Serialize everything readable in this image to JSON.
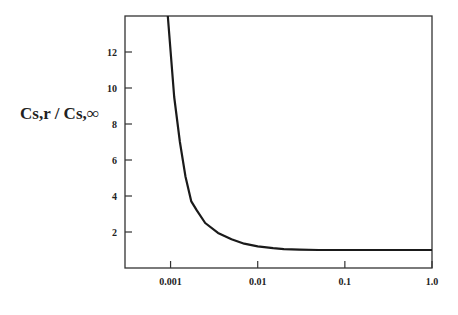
{
  "chart_data": {
    "type": "line",
    "title": "",
    "xlabel": "",
    "ylabel": "Cs,r / Cs,∞",
    "x_scale": "log",
    "xlim": [
      0.0003,
      1.0
    ],
    "ylim": [
      0,
      14
    ],
    "grid": false,
    "legend": null,
    "x_ticks": [
      {
        "value": 0.001,
        "label": "0.001"
      },
      {
        "value": 0.01,
        "label": "0.01"
      },
      {
        "value": 0.1,
        "label": "0.1"
      },
      {
        "value": 1.0,
        "label": "1.0"
      }
    ],
    "y_ticks": [
      {
        "value": 2,
        "label": "2"
      },
      {
        "value": 4,
        "label": "4"
      },
      {
        "value": 6,
        "label": "6"
      },
      {
        "value": 8,
        "label": "8"
      },
      {
        "value": 10,
        "label": "10"
      },
      {
        "value": 12,
        "label": "12"
      }
    ],
    "series": [
      {
        "name": "Cs,r / Cs,∞",
        "x": [
          0.00093,
          0.0011,
          0.00128,
          0.00148,
          0.00173,
          0.002,
          0.0025,
          0.0035,
          0.005,
          0.007,
          0.01,
          0.015,
          0.02,
          0.03,
          0.05,
          0.1,
          0.2,
          0.5,
          1.0
        ],
        "y": [
          14.0,
          9.5,
          7.0,
          5.1,
          3.7,
          3.2,
          2.5,
          1.95,
          1.6,
          1.35,
          1.2,
          1.1,
          1.05,
          1.02,
          1.0,
          1.0,
          1.0,
          1.0,
          1.0
        ]
      }
    ]
  },
  "plot_area": {
    "left": 125,
    "top": 16,
    "right": 432,
    "bottom": 268
  },
  "colors": {
    "line": "#1a1a1a",
    "axis": "#333333",
    "background": "#ffffff"
  }
}
